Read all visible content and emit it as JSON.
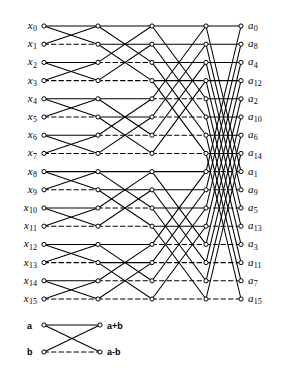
{
  "figure": {
    "stages": 4,
    "rows": 16,
    "colors": {
      "line": "#000000",
      "background": "#ffffff",
      "node_stroke": "#000000",
      "node_fill": "#ffffff"
    }
  },
  "inputs": [
    {
      "base": "x",
      "sub": "0"
    },
    {
      "base": "x",
      "sub": "1"
    },
    {
      "base": "x",
      "sub": "2"
    },
    {
      "base": "x",
      "sub": "3"
    },
    {
      "base": "x",
      "sub": "4"
    },
    {
      "base": "x",
      "sub": "5"
    },
    {
      "base": "x",
      "sub": "6"
    },
    {
      "base": "x",
      "sub": "7"
    },
    {
      "base": "x",
      "sub": "8"
    },
    {
      "base": "x",
      "sub": "9"
    },
    {
      "base": "x",
      "sub": "10"
    },
    {
      "base": "x",
      "sub": "11"
    },
    {
      "base": "x",
      "sub": "12"
    },
    {
      "base": "x",
      "sub": "13"
    },
    {
      "base": "x",
      "sub": "14"
    },
    {
      "base": "x",
      "sub": "15"
    }
  ],
  "outputs": [
    {
      "base": "a",
      "sub": "0"
    },
    {
      "base": "a",
      "sub": "8"
    },
    {
      "base": "a",
      "sub": "4"
    },
    {
      "base": "a",
      "sub": "12"
    },
    {
      "base": "a",
      "sub": "2"
    },
    {
      "base": "a",
      "sub": "10"
    },
    {
      "base": "a",
      "sub": "6"
    },
    {
      "base": "a",
      "sub": "14"
    },
    {
      "base": "a",
      "sub": "1"
    },
    {
      "base": "a",
      "sub": "9"
    },
    {
      "base": "a",
      "sub": "5"
    },
    {
      "base": "a",
      "sub": "13"
    },
    {
      "base": "a",
      "sub": "3"
    },
    {
      "base": "a",
      "sub": "11"
    },
    {
      "base": "a",
      "sub": "7"
    },
    {
      "base": "a",
      "sub": "15"
    }
  ],
  "legend": {
    "input_top": "a",
    "input_bottom": "b",
    "output_top": "a+b",
    "output_bottom": "a-b"
  },
  "chart_data": {
    "type": "diagram",
    "stage_spans": [
      1,
      2,
      4,
      8
    ],
    "columns_x": [
      44,
      98,
      152,
      206,
      241
    ],
    "row_y_first": 26,
    "row_y_step": 18.2,
    "n_rows": 16,
    "edge_styles": {
      "sum": "solid",
      "difference": "dashed"
    }
  }
}
